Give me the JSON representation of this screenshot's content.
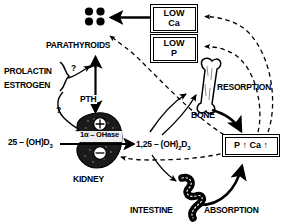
{
  "diagram": {
    "colors": {
      "ink": "#000000",
      "paper": "#ffffff"
    },
    "organs": {
      "parathyroids": "PARATHYROIDS",
      "kidney": "KIDNEY",
      "bone": "BONE",
      "intestine": "INTESTINE"
    },
    "boxes": [
      {
        "id": "low-ca",
        "line1": "LOW",
        "line2": "Ca"
      },
      {
        "id": "low-p",
        "line1": "LOW",
        "line2": "P"
      },
      {
        "id": "p-ca-up",
        "line1": "P ↑ Ca ↑",
        "line2": ""
      }
    ],
    "hormones": {
      "prolactin": "PROLACTIN",
      "estrogen": "ESTROGEN",
      "pth": "PTH"
    },
    "metabolites": {
      "precursor_main": "25 – (OH)D",
      "precursor_sub": "3",
      "active_main_a": "1,25 – (OH)",
      "active_sub_a": "2",
      "active_main_b": "D",
      "active_sub_b": "3",
      "enzyme_main": "1α – OHase"
    },
    "processes": {
      "resorption": "RESORPTION",
      "absorption": "ABSORPTION"
    },
    "annotations": {
      "question_upper": "?",
      "question_lower": "?",
      "plus_sign": "⊕",
      "minus_sign": "⊖"
    }
  }
}
